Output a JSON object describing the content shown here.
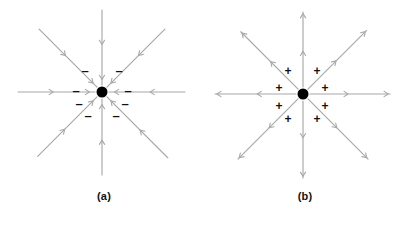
{
  "figure": {
    "type": "electric-field-line-diagram",
    "background_color": "#ffffff",
    "line_color": "#a8a8a8",
    "charge_color": "#000000",
    "sign_color": "#111111",
    "width": 407,
    "height": 226
  },
  "panels": [
    {
      "id": "a",
      "caption": "(a)",
      "caption_x": 104,
      "caption_y": 197,
      "charge": {
        "label": "negative-point-charge",
        "cx": 102,
        "cy": 92,
        "r": 5.5,
        "color": "#000000"
      },
      "field_direction": "inward",
      "sign_glyph": "–",
      "sign_name": "minus-sign",
      "sign_count": 8,
      "signs": [
        {
          "x": 85,
          "y": 72,
          "glyph": "–"
        },
        {
          "x": 119,
          "y": 72,
          "glyph": "–"
        },
        {
          "x": 76,
          "y": 92,
          "glyph": "–"
        },
        {
          "x": 128,
          "y": 92,
          "glyph": "–"
        },
        {
          "x": 79,
          "y": 105,
          "glyph": "–"
        },
        {
          "x": 125,
          "y": 105,
          "glyph": "–"
        },
        {
          "x": 88,
          "y": 117,
          "glyph": "–"
        },
        {
          "x": 116,
          "y": 117,
          "glyph": "–"
        }
      ],
      "rays": [
        {
          "name": "ray-up",
          "angle_deg": 270,
          "length": 82,
          "tip_x": 102,
          "tip_y": 10
        },
        {
          "name": "ray-down",
          "angle_deg": 90,
          "length": 83,
          "tip_x": 102,
          "tip_y": 175
        },
        {
          "name": "ray-left",
          "angle_deg": 180,
          "length": 84,
          "tip_x": 18,
          "tip_y": 92
        },
        {
          "name": "ray-right",
          "angle_deg": 0,
          "length": 83,
          "tip_x": 185,
          "tip_y": 92
        },
        {
          "name": "ray-up-left",
          "angle_deg": 225,
          "length": 89,
          "tip_x": 38,
          "tip_y": 30
        },
        {
          "name": "ray-up-right",
          "angle_deg": 315,
          "length": 89,
          "tip_x": 166,
          "tip_y": 30
        },
        {
          "name": "ray-down-left",
          "angle_deg": 135,
          "length": 91,
          "tip_x": 38,
          "tip_y": 157
        },
        {
          "name": "ray-down-right",
          "angle_deg": 45,
          "length": 93,
          "tip_x": 168,
          "tip_y": 158
        }
      ]
    },
    {
      "id": "b",
      "caption": "(b)",
      "caption_x": 305,
      "caption_y": 197,
      "charge": {
        "label": "positive-point-charge",
        "cx": 303,
        "cy": 94,
        "r": 5.5,
        "color": "#000000"
      },
      "field_direction": "outward",
      "sign_glyph": "+",
      "sign_name": "plus-sign",
      "sign_count": 8,
      "signs": [
        {
          "x": 288,
          "y": 72,
          "glyph": "+"
        },
        {
          "x": 317,
          "y": 72,
          "glyph": "+"
        },
        {
          "x": 279,
          "y": 89,
          "glyph": "+"
        },
        {
          "x": 325,
          "y": 89,
          "glyph": "+"
        },
        {
          "x": 279,
          "y": 107,
          "glyph": "+"
        },
        {
          "x": 325,
          "y": 107,
          "glyph": "+"
        },
        {
          "x": 288,
          "y": 120,
          "glyph": "+"
        },
        {
          "x": 317,
          "y": 120,
          "glyph": "+"
        }
      ],
      "rays": [
        {
          "name": "ray-up",
          "angle_deg": 270,
          "length": 82,
          "tip_x": 303,
          "tip_y": 12
        },
        {
          "name": "ray-down",
          "angle_deg": 90,
          "length": 84,
          "tip_x": 303,
          "tip_y": 178
        },
        {
          "name": "ray-left",
          "angle_deg": 180,
          "length": 88,
          "tip_x": 215,
          "tip_y": 94
        },
        {
          "name": "ray-right",
          "angle_deg": 0,
          "length": 87,
          "tip_x": 390,
          "tip_y": 94
        },
        {
          "name": "ray-up-left",
          "angle_deg": 225,
          "length": 88,
          "tip_x": 241,
          "tip_y": 32
        },
        {
          "name": "ray-up-right",
          "angle_deg": 315,
          "length": 90,
          "tip_x": 367,
          "tip_y": 31
        },
        {
          "name": "ray-down-left",
          "angle_deg": 135,
          "length": 92,
          "tip_x": 238,
          "tip_y": 159
        },
        {
          "name": "ray-down-right",
          "angle_deg": 45,
          "length": 92,
          "tip_x": 368,
          "tip_y": 159
        }
      ]
    }
  ]
}
